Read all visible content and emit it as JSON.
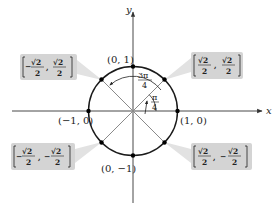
{
  "diagram": {
    "type": "unit-circle",
    "axes": {
      "x_label": "x",
      "y_label": "y"
    },
    "axis_points": [
      {
        "label": "(0, 1)",
        "x": 0,
        "y": 1
      },
      {
        "label": "(1, 0)",
        "x": 1,
        "y": 0
      },
      {
        "label": "(−1, 0)",
        "x": -1,
        "y": 0
      },
      {
        "label": "(0, −1)",
        "x": 0,
        "y": -1
      }
    ],
    "angles": [
      {
        "label_num": "π",
        "label_den": "4",
        "label": "π/4"
      },
      {
        "label_num": "3π",
        "label_den": "4",
        "label": "3π/4"
      }
    ],
    "diagonal_points": {
      "q1": {
        "x_sign": "",
        "y_sign": "",
        "num": "√2",
        "den": "2",
        "label": "(√2/2, √2/2)"
      },
      "q2": {
        "x_sign": "−",
        "y_sign": "",
        "num": "√2",
        "den": "2",
        "label": "(−√2/2, √2/2)"
      },
      "q3": {
        "x_sign": "−",
        "y_sign": "−",
        "num": "√2",
        "den": "2",
        "label": "(−√2/2, −√2/2)"
      },
      "q4": {
        "x_sign": "",
        "y_sign": "−",
        "num": "√2",
        "den": "2",
        "label": "(√2/2, −√2/2)"
      }
    },
    "colors": {
      "circle": "#1a1a1a",
      "axis": "#333333",
      "diagonal": "#8a8a8a",
      "box_fill": "#d4d4d4",
      "connector": "#e2e2e2",
      "dot": "#000000"
    }
  }
}
